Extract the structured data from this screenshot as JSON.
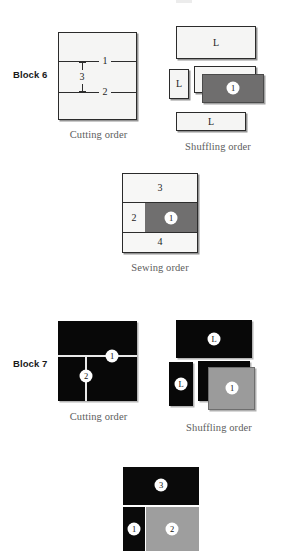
{
  "figure": {
    "blocks": [
      {
        "id": "block-6",
        "label": "Block 6",
        "fabric_tone": "light",
        "panels": [
          {
            "id": "cutting",
            "caption": "Cutting order",
            "cut_labels": [
              "1",
              "3",
              "2"
            ]
          },
          {
            "id": "shuffling",
            "caption": "Shuffling order",
            "piece_labels": [
              "L",
              "L",
              "1",
              "L"
            ]
          },
          {
            "id": "sewing",
            "caption": "Sewing order",
            "cell_labels": [
              "3",
              "2",
              "1",
              "4"
            ]
          }
        ],
        "colors": {
          "fabric": "#f5f5f4",
          "accent": "#6f6e6e",
          "outline": "#2b2b2b"
        }
      },
      {
        "id": "block-7",
        "label": "Block 7",
        "fabric_tone": "dark",
        "panels": [
          {
            "id": "cutting",
            "caption": "Cutting order",
            "cut_labels": [
              "1",
              "2"
            ]
          },
          {
            "id": "shuffling",
            "caption": "Shuffling order",
            "piece_labels": [
              "L",
              "L",
              "1"
            ]
          },
          {
            "id": "sewing",
            "caption": "",
            "cell_labels": [
              "3",
              "1",
              "2"
            ]
          }
        ],
        "colors": {
          "fabric": "#080808",
          "accent": "#9b9b9b",
          "outline": "#080808"
        }
      }
    ]
  }
}
